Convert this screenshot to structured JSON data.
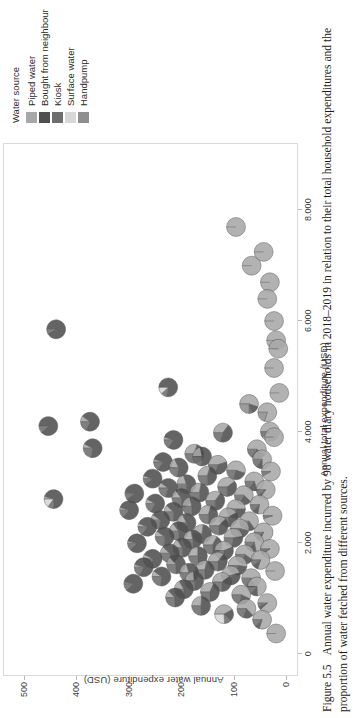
{
  "figure": {
    "number": "Figure 5.5",
    "caption": "Annual water expenditure incurred by 98 water diary households in 2018–2019 in relation to their total household expenditures and the proportion of water fetched from different sources."
  },
  "legend": {
    "title": "Water source",
    "items": [
      {
        "label": "Piped water",
        "color": "#a8a8a8"
      },
      {
        "label": "Bought from neighbour",
        "color": "#4f4f4f"
      },
      {
        "label": "Kiosk",
        "color": "#6e6e6e"
      },
      {
        "label": "Surface water",
        "color": "#d8d8d8"
      },
      {
        "label": "Handpump",
        "color": "#8f8f8f"
      }
    ]
  },
  "chart_data": {
    "type": "scatter",
    "title": "",
    "xlabel": "Annual total expenditure (USD)",
    "ylabel": "Annual water expenditure (USD)",
    "xlim": [
      -400,
      9200
    ],
    "ylim": [
      -22,
      540
    ],
    "xticks": [
      0,
      2000,
      4000,
      6000,
      8000
    ],
    "xticklabels": [
      "0",
      "2.000",
      "4.000",
      "6.000",
      "8.000"
    ],
    "yticks": [
      0,
      100,
      200,
      300,
      400,
      500
    ],
    "yticklabels": [
      "0",
      "100",
      "200",
      "300",
      "400",
      "500"
    ],
    "grid": false,
    "legend_position": "right",
    "marker": "pie",
    "n_points": 98,
    "series_names": [
      "Piped water",
      "Bought from neighbour",
      "Kiosk",
      "Surface water",
      "Handpump"
    ],
    "series_colors": [
      "#a8a8a8",
      "#4f4f4f",
      "#6e6e6e",
      "#d8d8d8",
      "#8f8f8f"
    ],
    "points": [
      {
        "x": 7700,
        "y": 95,
        "shares": [
          1.0,
          0,
          0,
          0,
          0
        ]
      },
      {
        "x": 7000,
        "y": 65,
        "shares": [
          1.0,
          0,
          0,
          0,
          0
        ]
      },
      {
        "x": 7250,
        "y": 42,
        "shares": [
          1.0,
          0,
          0,
          0,
          0
        ]
      },
      {
        "x": 6700,
        "y": 30,
        "shares": [
          1.0,
          0,
          0,
          0,
          0
        ]
      },
      {
        "x": 6000,
        "y": 22,
        "shares": [
          1.0,
          0,
          0,
          0,
          0
        ]
      },
      {
        "x": 6400,
        "y": 35,
        "shares": [
          1.0,
          0,
          0,
          0,
          0
        ]
      },
      {
        "x": 5850,
        "y": 440,
        "shares": [
          0,
          0.92,
          0.08,
          0,
          0
        ]
      },
      {
        "x": 5650,
        "y": 18,
        "shares": [
          1.0,
          0,
          0,
          0,
          0
        ]
      },
      {
        "x": 5500,
        "y": 14,
        "shares": [
          1.0,
          0,
          0,
          0,
          0
        ]
      },
      {
        "x": 5150,
        "y": 22,
        "shares": [
          1.0,
          0,
          0,
          0,
          0
        ]
      },
      {
        "x": 4800,
        "y": 225,
        "shares": [
          0,
          0.78,
          0.1,
          0.12,
          0
        ]
      },
      {
        "x": 4700,
        "y": 12,
        "shares": [
          1.0,
          0,
          0,
          0,
          0
        ]
      },
      {
        "x": 4500,
        "y": 70,
        "shares": [
          0.55,
          0.15,
          0.05,
          0,
          0.25
        ]
      },
      {
        "x": 4350,
        "y": 35,
        "shares": [
          0.8,
          0,
          0,
          0,
          0.2
        ]
      },
      {
        "x": 4180,
        "y": 375,
        "shares": [
          0.1,
          0.72,
          0.18,
          0,
          0
        ]
      },
      {
        "x": 4100,
        "y": 455,
        "shares": [
          0,
          0.88,
          0.12,
          0,
          0
        ]
      },
      {
        "x": 4000,
        "y": 30,
        "shares": [
          0.9,
          0,
          0.1,
          0,
          0
        ]
      },
      {
        "x": 3980,
        "y": 120,
        "shares": [
          0.35,
          0.45,
          0.2,
          0,
          0
        ]
      },
      {
        "x": 3900,
        "y": 22,
        "shares": [
          1.0,
          0,
          0,
          0,
          0
        ]
      },
      {
        "x": 3850,
        "y": 215,
        "shares": [
          0.05,
          0.8,
          0.15,
          0,
          0
        ]
      },
      {
        "x": 3700,
        "y": 370,
        "shares": [
          0.08,
          0.7,
          0.22,
          0,
          0
        ]
      },
      {
        "x": 3680,
        "y": 55,
        "shares": [
          0.6,
          0.25,
          0.15,
          0,
          0
        ]
      },
      {
        "x": 3600,
        "y": 175,
        "shares": [
          0.3,
          0.4,
          0.3,
          0,
          0
        ]
      },
      {
        "x": 3550,
        "y": 160,
        "shares": [
          0.22,
          0.55,
          0.23,
          0,
          0
        ]
      },
      {
        "x": 3500,
        "y": 45,
        "shares": [
          0.75,
          0.1,
          0.15,
          0,
          0
        ]
      },
      {
        "x": 3450,
        "y": 235,
        "shares": [
          0.05,
          0.8,
          0.15,
          0,
          0
        ]
      },
      {
        "x": 3400,
        "y": 130,
        "shares": [
          0.45,
          0.35,
          0.2,
          0,
          0
        ]
      },
      {
        "x": 3350,
        "y": 205,
        "shares": [
          0.18,
          0.6,
          0.22,
          0,
          0
        ]
      },
      {
        "x": 3300,
        "y": 95,
        "shares": [
          0.55,
          0.25,
          0.2,
          0,
          0
        ]
      },
      {
        "x": 3280,
        "y": 28,
        "shares": [
          0.92,
          0,
          0.08,
          0,
          0
        ]
      },
      {
        "x": 3200,
        "y": 150,
        "shares": [
          0.3,
          0.45,
          0.25,
          0,
          0
        ]
      },
      {
        "x": 3150,
        "y": 255,
        "shares": [
          0.05,
          0.85,
          0.1,
          0,
          0
        ]
      },
      {
        "x": 3100,
        "y": 60,
        "shares": [
          0.7,
          0.15,
          0.15,
          0,
          0
        ]
      },
      {
        "x": 3050,
        "y": 190,
        "shares": [
          0.2,
          0.55,
          0.25,
          0,
          0
        ]
      },
      {
        "x": 3000,
        "y": 112,
        "shares": [
          0.4,
          0.35,
          0.25,
          0,
          0
        ]
      },
      {
        "x": 2980,
        "y": 225,
        "shares": [
          0.1,
          0.7,
          0.2,
          0,
          0
        ]
      },
      {
        "x": 2950,
        "y": 38,
        "shares": [
          0.85,
          0.05,
          0.1,
          0,
          0
        ]
      },
      {
        "x": 2900,
        "y": 165,
        "shares": [
          0.28,
          0.48,
          0.24,
          0,
          0
        ]
      },
      {
        "x": 2880,
        "y": 290,
        "shares": [
          0.02,
          0.88,
          0.1,
          0,
          0
        ]
      },
      {
        "x": 2850,
        "y": 80,
        "shares": [
          0.62,
          0.2,
          0.18,
          0,
          0
        ]
      },
      {
        "x": 2800,
        "y": 200,
        "shares": [
          0.15,
          0.6,
          0.25,
          0,
          0
        ]
      },
      {
        "x": 2780,
        "y": 445,
        "shares": [
          0.05,
          0.7,
          0.1,
          0.15,
          0
        ]
      },
      {
        "x": 2750,
        "y": 135,
        "shares": [
          0.35,
          0.4,
          0.25,
          0,
          0
        ]
      },
      {
        "x": 2700,
        "y": 250,
        "shares": [
          0.08,
          0.75,
          0.17,
          0,
          0
        ]
      },
      {
        "x": 2680,
        "y": 50,
        "shares": [
          0.78,
          0.1,
          0.12,
          0,
          0
        ]
      },
      {
        "x": 2650,
        "y": 180,
        "shares": [
          0.22,
          0.53,
          0.25,
          0,
          0
        ]
      },
      {
        "x": 2600,
        "y": 95,
        "shares": [
          0.5,
          0.28,
          0.22,
          0,
          0
        ]
      },
      {
        "x": 2580,
        "y": 300,
        "shares": [
          0.05,
          0.82,
          0.13,
          0,
          0
        ]
      },
      {
        "x": 2550,
        "y": 215,
        "shares": [
          0.12,
          0.63,
          0.25,
          0,
          0
        ]
      },
      {
        "x": 2500,
        "y": 148,
        "shares": [
          0.3,
          0.45,
          0.25,
          0,
          0
        ]
      },
      {
        "x": 2480,
        "y": 25,
        "shares": [
          0.95,
          0,
          0.05,
          0,
          0
        ]
      },
      {
        "x": 2450,
        "y": 110,
        "shares": [
          0.42,
          0.33,
          0.25,
          0,
          0
        ]
      },
      {
        "x": 2400,
        "y": 240,
        "shares": [
          0.1,
          0.68,
          0.22,
          0,
          0
        ]
      },
      {
        "x": 2380,
        "y": 70,
        "shares": [
          0.65,
          0.18,
          0.17,
          0,
          0
        ]
      },
      {
        "x": 2350,
        "y": 190,
        "shares": [
          0.18,
          0.57,
          0.25,
          0,
          0
        ]
      },
      {
        "x": 2300,
        "y": 128,
        "shares": [
          0.38,
          0.37,
          0.25,
          0,
          0
        ]
      },
      {
        "x": 2280,
        "y": 265,
        "shares": [
          0.06,
          0.79,
          0.15,
          0,
          0
        ]
      },
      {
        "x": 2250,
        "y": 88,
        "shares": [
          0.55,
          0.22,
          0.23,
          0,
          0
        ]
      },
      {
        "x": 2200,
        "y": 205,
        "shares": [
          0.15,
          0.6,
          0.25,
          0,
          0
        ]
      },
      {
        "x": 2180,
        "y": 42,
        "shares": [
          0.82,
          0.08,
          0.1,
          0,
          0
        ]
      },
      {
        "x": 2150,
        "y": 160,
        "shares": [
          0.27,
          0.48,
          0.25,
          0,
          0
        ]
      },
      {
        "x": 2100,
        "y": 232,
        "shares": [
          0.1,
          0.66,
          0.24,
          0,
          0
        ]
      },
      {
        "x": 2080,
        "y": 100,
        "shares": [
          0.48,
          0.3,
          0.22,
          0,
          0
        ]
      },
      {
        "x": 2050,
        "y": 178,
        "shares": [
          0.22,
          0.53,
          0.25,
          0,
          0
        ]
      },
      {
        "x": 2000,
        "y": 60,
        "shares": [
          0.72,
          0.14,
          0.14,
          0,
          0
        ]
      },
      {
        "x": 1980,
        "y": 285,
        "shares": [
          0.04,
          0.84,
          0.12,
          0,
          0
        ]
      },
      {
        "x": 1950,
        "y": 140,
        "shares": [
          0.33,
          0.42,
          0.25,
          0,
          0
        ]
      },
      {
        "x": 1900,
        "y": 198,
        "shares": [
          0.16,
          0.59,
          0.25,
          0,
          0
        ]
      },
      {
        "x": 1880,
        "y": 30,
        "shares": [
          0.9,
          0.04,
          0.06,
          0,
          0
        ]
      },
      {
        "x": 1850,
        "y": 118,
        "shares": [
          0.44,
          0.31,
          0.25,
          0,
          0
        ]
      },
      {
        "x": 1800,
        "y": 222,
        "shares": [
          0.12,
          0.63,
          0.25,
          0,
          0
        ]
      },
      {
        "x": 1780,
        "y": 78,
        "shares": [
          0.6,
          0.2,
          0.2,
          0,
          0
        ]
      },
      {
        "x": 1750,
        "y": 168,
        "shares": [
          0.25,
          0.5,
          0.25,
          0,
          0
        ]
      },
      {
        "x": 1700,
        "y": 255,
        "shares": [
          0.08,
          0.7,
          0.22,
          0,
          0
        ]
      },
      {
        "x": 1680,
        "y": 48,
        "shares": [
          0.8,
          0.1,
          0.1,
          0,
          0
        ]
      },
      {
        "x": 1650,
        "y": 130,
        "shares": [
          0.36,
          0.39,
          0.25,
          0,
          0
        ]
      },
      {
        "x": 1600,
        "y": 210,
        "shares": [
          0.14,
          0.61,
          0.25,
          0,
          0
        ]
      },
      {
        "x": 1580,
        "y": 92,
        "shares": [
          0.52,
          0.26,
          0.22,
          0,
          0
        ]
      },
      {
        "x": 1550,
        "y": 272,
        "shares": [
          0.05,
          0.78,
          0.17,
          0,
          0
        ]
      },
      {
        "x": 1500,
        "y": 155,
        "shares": [
          0.29,
          0.46,
          0.25,
          0,
          0
        ]
      },
      {
        "x": 1480,
        "y": 20,
        "shares": [
          1.0,
          0,
          0,
          0,
          0
        ]
      },
      {
        "x": 1450,
        "y": 185,
        "shares": [
          0.2,
          0.55,
          0.25,
          0,
          0
        ]
      },
      {
        "x": 1400,
        "y": 105,
        "shares": [
          0.46,
          0.29,
          0.25,
          0,
          0
        ]
      },
      {
        "x": 1380,
        "y": 238,
        "shares": [
          0.1,
          0.66,
          0.24,
          0,
          0
        ]
      },
      {
        "x": 1350,
        "y": 66,
        "shares": [
          0.68,
          0.16,
          0.16,
          0,
          0
        ]
      },
      {
        "x": 1300,
        "y": 175,
        "shares": [
          0.24,
          0.51,
          0.25,
          0,
          0
        ]
      },
      {
        "x": 1280,
        "y": 122,
        "shares": [
          0.4,
          0.35,
          0.25,
          0,
          0
        ]
      },
      {
        "x": 1250,
        "y": 292,
        "shares": [
          0.03,
          0.85,
          0.12,
          0,
          0
        ]
      },
      {
        "x": 1200,
        "y": 55,
        "shares": [
          0.74,
          0.13,
          0.13,
          0,
          0
        ]
      },
      {
        "x": 1150,
        "y": 195,
        "shares": [
          0.17,
          0.58,
          0.25,
          0,
          0
        ]
      },
      {
        "x": 1100,
        "y": 145,
        "shares": [
          0.32,
          0.43,
          0.25,
          0,
          0
        ]
      },
      {
        "x": 1050,
        "y": 85,
        "shares": [
          0.57,
          0.21,
          0.22,
          0,
          0
        ]
      },
      {
        "x": 1000,
        "y": 212,
        "shares": [
          0.13,
          0.62,
          0.25,
          0,
          0
        ]
      },
      {
        "x": 900,
        "y": 35,
        "shares": [
          0.88,
          0.06,
          0.06,
          0,
          0
        ]
      },
      {
        "x": 850,
        "y": 162,
        "shares": [
          0.26,
          0.49,
          0.25,
          0,
          0
        ]
      },
      {
        "x": 800,
        "y": 75,
        "shares": [
          0.63,
          0.18,
          0.19,
          0,
          0
        ]
      },
      {
        "x": 700,
        "y": 118,
        "shares": [
          0.42,
          0.2,
          0.12,
          0.26,
          0
        ]
      },
      {
        "x": 600,
        "y": 45,
        "shares": [
          0.8,
          0.08,
          0.12,
          0,
          0
        ]
      },
      {
        "x": 350,
        "y": 18,
        "shares": [
          1.0,
          0,
          0,
          0,
          0
        ]
      }
    ]
  }
}
